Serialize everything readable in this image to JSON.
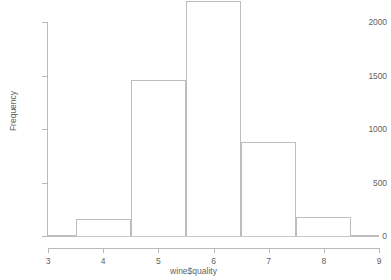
{
  "chart_data": {
    "type": "bar",
    "title": "Histogram of wine$quality",
    "xlabel": "wine$quality",
    "ylabel": "Frequency",
    "xlim": [
      3,
      9
    ],
    "ylim": [
      0,
      2200
    ],
    "grid": false,
    "legend": null,
    "bin_width": 1,
    "bins": [
      {
        "label": "3",
        "x_start": 3.0,
        "x_end": 3.5,
        "value": 10
      },
      {
        "label": "4",
        "x_start": 3.5,
        "x_end": 4.5,
        "value": 163
      },
      {
        "label": "5",
        "x_start": 4.5,
        "x_end": 5.5,
        "value": 1457
      },
      {
        "label": "6",
        "x_start": 5.5,
        "x_end": 6.5,
        "value": 2198
      },
      {
        "label": "7",
        "x_start": 6.5,
        "x_end": 7.5,
        "value": 880
      },
      {
        "label": "8",
        "x_start": 7.5,
        "x_end": 8.5,
        "value": 175
      },
      {
        "label": "9",
        "x_start": 8.5,
        "x_end": 9.0,
        "value": 5
      }
    ],
    "categories": [
      "3",
      "4",
      "5",
      "6",
      "7",
      "8",
      "9"
    ],
    "values": [
      10,
      163,
      1457,
      2198,
      880,
      175,
      5
    ],
    "x_ticks": [
      3,
      4,
      5,
      6,
      7,
      8,
      9
    ],
    "y_ticks": [
      0,
      500,
      1000,
      1500,
      2000
    ]
  },
  "axes": {
    "y_tick_labels": [
      "0",
      "500",
      "1000",
      "1500",
      "2000"
    ],
    "x_tick_labels": [
      "3",
      "4",
      "5",
      "6",
      "7",
      "8",
      "9"
    ],
    "y_title": "Frequency",
    "x_title": "wine$quality"
  },
  "colors": {
    "bar_outline": "#bdbdbd",
    "axis": "#b9b9b9",
    "text": "#5f5f5f",
    "background": "#ffffff"
  },
  "title_text": "Histogram of wine$quality"
}
